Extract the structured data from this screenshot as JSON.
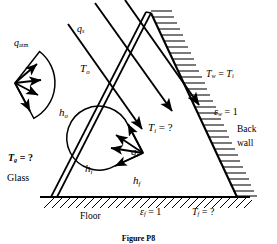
{
  "figure": {
    "caption": "Figure P8",
    "background_color": "#ffffff",
    "line_color": "#000000"
  },
  "labels": {
    "q_atm": {
      "base": "q",
      "sub": "atm",
      "sup": "",
      "x": 14,
      "y": 44,
      "size": 10
    },
    "q_s": {
      "base": "q",
      "sub": "s",
      "sup": "",
      "x": 77,
      "y": 30,
      "size": 10
    },
    "T_o": {
      "base": "T",
      "sub": "o",
      "sup": "",
      "x": 80,
      "y": 69,
      "size": 10
    },
    "h_o": {
      "base": "h",
      "sub": "o",
      "sup": "",
      "x": 59,
      "y": 113,
      "size": 10
    },
    "T_g": {
      "text_base": "T",
      "sub": "g",
      "tail": " = ?",
      "x": 8,
      "y": 160,
      "size": 10
    },
    "glass": {
      "text": "Glass",
      "x": 7,
      "y": 179,
      "size": 10
    },
    "h_i": {
      "base": "h",
      "sub": "i",
      "sup": "",
      "x": 85,
      "y": 169,
      "size": 10
    },
    "q_i": {
      "base": "q",
      "sub": "i",
      "sup": "−",
      "x": 131,
      "y": 152,
      "size": 10
    },
    "T_i": {
      "text_base": "T",
      "sub": "i",
      "tail": " = ?",
      "x": 148,
      "y": 128,
      "size": 10
    },
    "h_f": {
      "base": "h",
      "sub": "f",
      "sup": "",
      "x": 133,
      "y": 181,
      "size": 10
    },
    "T_w": {
      "text": "Tᵥ = Tᵢ",
      "x": 206,
      "y": 75,
      "size": 10
    },
    "e_w": {
      "text_base": "ε",
      "sub": "w",
      "tail": " = 1",
      "x": 214,
      "y": 113,
      "size": 10
    },
    "back_wall_1": {
      "text": "Back",
      "x": 237,
      "y": 132,
      "size": 9.5
    },
    "back_wall_2": {
      "text": "wall",
      "x": 237,
      "y": 146,
      "size": 9.5
    },
    "floor": {
      "text": "Floor",
      "x": 80,
      "y": 218,
      "size": 9.5
    },
    "e_f": {
      "text_base": "ε",
      "sub": "f",
      "tail": " = 1",
      "x": 140,
      "y": 213,
      "size": 10
    },
    "T_f": {
      "text_base": "T",
      "sub": "f",
      "tail": " = ?",
      "x": 192,
      "y": 213,
      "size": 10
    }
  },
  "text_values": {
    "q_atm": "q_atm",
    "q_s": "q_s",
    "T_o": "T_o",
    "h_o": "h_o",
    "T_g_eq": "T_g = ?",
    "glass": "Glass",
    "h_i": "h_i",
    "q_i_minus": "q_i^-",
    "T_i_eq": "T_i = ?",
    "h_f": "h_f",
    "T_w_eq": "T_w = T_i",
    "e_w_eq": "ε_w = 1",
    "back_wall": "Back wall",
    "floor": "Floor",
    "e_f_eq": "ε_f = 1",
    "T_f_eq": "T_f = ?",
    "caption": "Figure P8"
  },
  "geometry": {
    "apex": {
      "x": 151,
      "y": 13
    },
    "glass_bottom": {
      "x": 57,
      "y": 197
    },
    "wall_bottom": {
      "x": 237,
      "y": 197
    },
    "floor_y": 197,
    "floor_x_left": 40,
    "floor_x_right": 250,
    "glass_thickness": 5
  },
  "fans": {
    "q_atm": {
      "cx": 15,
      "cy": 83,
      "radius": 40,
      "start_deg": -52,
      "end_deg": 62,
      "arrows": 4,
      "direction": "inward-right"
    },
    "q_i": {
      "cx": 143,
      "cy": 153,
      "radius": 32,
      "start_deg": 118,
      "end_deg": 255,
      "arrows": 4,
      "direction": "inward-left"
    }
  },
  "solar_rays": {
    "count": 3,
    "direction_deg": 58,
    "label": "q_s"
  }
}
